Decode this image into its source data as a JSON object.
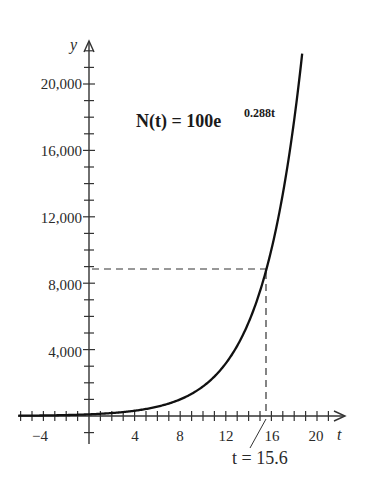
{
  "chart_data": {
    "type": "line",
    "title": "",
    "xlabel": "t",
    "ylabel": "y",
    "function_label": {
      "prefix": "N(t) = 100e",
      "exponent": "0.288t"
    },
    "xlim": [
      -6,
      22
    ],
    "ylim": [
      0,
      22000
    ],
    "x_ticks_major": [
      -4,
      4,
      8,
      12,
      16,
      20
    ],
    "x_tick_labels": [
      "−4",
      "4",
      "8",
      "12",
      "16",
      "20"
    ],
    "x_minor_step": 1,
    "y_ticks_major": [
      4000,
      8000,
      12000,
      16000,
      20000
    ],
    "y_tick_labels": [
      "4,000",
      "8,000",
      "12,000",
      "16,000",
      "20,000"
    ],
    "y_minor_step": 1000,
    "grid": false,
    "legend": null,
    "series": [
      {
        "name": "N(t) = 100e^(0.288t)",
        "x": [
          -6,
          -4,
          -2,
          0,
          2,
          4,
          6,
          8,
          10,
          12,
          14,
          15.6,
          16,
          17,
          18,
          18.7
        ],
        "values": [
          18,
          32,
          56,
          100,
          178,
          316,
          563,
          1003,
          1786,
          3181,
          5666,
          8948,
          10090,
          13437,
          17894,
          21949
        ]
      }
    ],
    "annotations": [
      {
        "type": "dashed-guide",
        "point": [
          15.6,
          9000
        ],
        "text": "t = 15.6"
      }
    ]
  },
  "labels": {
    "y_axis": "y",
    "t_axis": "t",
    "formula_main": "N(t) = 100e",
    "formula_exp": "0.288t",
    "t_annotation": "t = 15.6",
    "y_ticks": [
      "20,000",
      "16,000",
      "12,000",
      "8,000",
      "4,000"
    ],
    "t_ticks": [
      "−4",
      "4",
      "8",
      "12",
      "16",
      "20"
    ]
  }
}
